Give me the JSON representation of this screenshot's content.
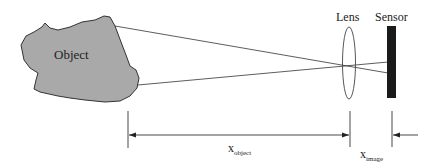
{
  "labels": {
    "object": "Object",
    "lens": "Lens",
    "sensor": "Sensor",
    "x_object": "x",
    "x_object_sub": "object",
    "x_image": "x",
    "x_image_sub": "image"
  },
  "colors": {
    "object_fill": "#a9a9a9",
    "object_stroke": "#333333",
    "sensor_fill": "#1a1a1a",
    "line": "#333333"
  }
}
